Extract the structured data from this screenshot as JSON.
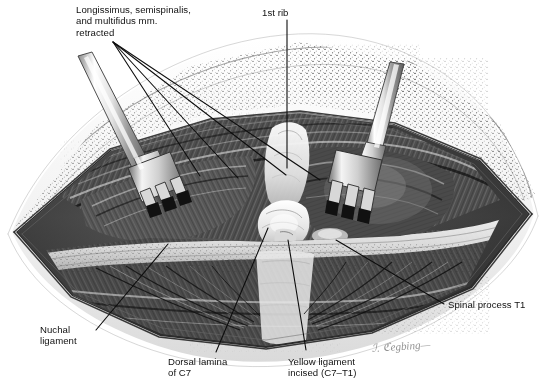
{
  "figure": {
    "background_color": "#ffffff",
    "ink_color": "#111111",
    "width": 546,
    "height": 389
  },
  "labels": [
    {
      "id": "longissimus",
      "name": "label-longissimus-semispinalis-multifidus",
      "lines": [
        "Longissimus, semispinalis,",
        "and multifidus mm.",
        "retracted"
      ],
      "text": "Longissimus, semispinalis,\nand multifidus mm.\nretracted",
      "x": 76,
      "y": 4,
      "align": "left"
    },
    {
      "id": "first_rib",
      "name": "label-first-rib",
      "lines": [
        "1st rib"
      ],
      "text": "1st rib",
      "x": 262,
      "y": 7,
      "align": "left"
    },
    {
      "id": "spinal_process_t1",
      "name": "label-spinal-process-t1",
      "lines": [
        "Spinal process T1"
      ],
      "text": "Spinal process T1",
      "x": 448,
      "y": 299,
      "align": "left"
    },
    {
      "id": "nuchal_ligament",
      "name": "label-nuchal-ligament",
      "lines": [
        "Nuchal",
        "ligament"
      ],
      "text": "Nuchal\nligament",
      "x": 40,
      "y": 324,
      "align": "left"
    },
    {
      "id": "dorsal_lamina_c7",
      "name": "label-dorsal-lamina-c7",
      "lines": [
        "Dorsal lamina",
        "of C7"
      ],
      "text": "Dorsal lamina\nof C7",
      "x": 168,
      "y": 356,
      "align": "left"
    },
    {
      "id": "yellow_ligament",
      "name": "label-yellow-ligament-incised",
      "lines": [
        "Yellow ligament",
        "incised (C7–T1)"
      ],
      "text": "Yellow ligament\nincised (C7–T1)",
      "x": 288,
      "y": 356,
      "align": "left"
    }
  ],
  "signature": {
    "name": "artist-signature",
    "text": "ℐ. ℭegbing—",
    "x": 372,
    "y": 340
  },
  "instruments": [
    {
      "id": "retractor-left",
      "name": "surgical-retractor-left",
      "prongs": 3
    },
    {
      "id": "retractor-right",
      "name": "surgical-retractor-right",
      "prongs": 3
    }
  ],
  "leader_lines": {
    "name": "leader-lines",
    "stroke": "#111111",
    "count": 9
  }
}
